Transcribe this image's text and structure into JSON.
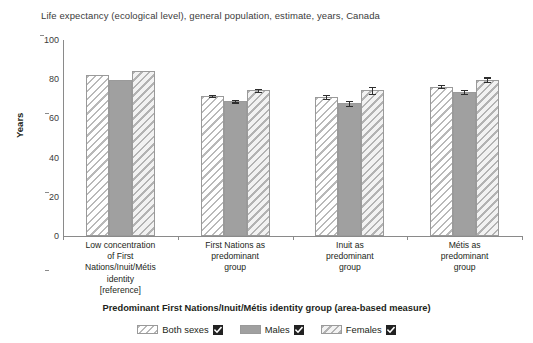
{
  "chart_data": {
    "type": "bar",
    "title": "Life expectancy (ecological level), general population, estimate, years, Canada",
    "xlabel": "Predominant First Nations/Inuit/Métis identity group (area-based measure)",
    "ylabel": "Years",
    "ylim": [
      0,
      100
    ],
    "yticks": [
      0,
      20,
      40,
      60,
      80,
      100
    ],
    "grid": false,
    "legend_position": "bottom",
    "categories": [
      "Low concentration of First Nations/Inuit/Métis identity [reference]",
      "First Nations as predominant group",
      "Inuit as predominant group",
      "Métis as predominant group"
    ],
    "category_lines": [
      [
        "Low concentration",
        "of First",
        "Nations/Inuit/Métis",
        "identity",
        "[reference]"
      ],
      [
        "First Nations as",
        "predominant",
        "group"
      ],
      [
        "Inuit as",
        "predominant",
        "group"
      ],
      [
        "Métis as",
        "predominant",
        "group"
      ]
    ],
    "series": [
      {
        "name": "Both sexes",
        "pattern": "hatch-a",
        "values": [
          82.0,
          71.5,
          71.0,
          76.2
        ],
        "errors": [
          0.0,
          0.5,
          1.0,
          0.8
        ]
      },
      {
        "name": "Males",
        "pattern": "solid",
        "values": [
          79.8,
          68.8,
          67.8,
          73.5
        ],
        "errors": [
          0.0,
          0.6,
          1.3,
          0.9
        ]
      },
      {
        "name": "Females",
        "pattern": "hatch-b",
        "values": [
          84.4,
          74.4,
          74.3,
          79.8
        ],
        "errors": [
          0.0,
          0.7,
          1.6,
          1.1
        ]
      }
    ]
  },
  "legend": {
    "items": [
      {
        "label": "Both sexes",
        "checked": true,
        "swatch": "hatch-a"
      },
      {
        "label": "Males",
        "checked": true,
        "swatch": "solid"
      },
      {
        "label": "Females",
        "checked": true,
        "swatch": "hatch-b"
      }
    ],
    "check_icon": "checkbox-checked-icon"
  },
  "colors": {
    "solid_fill": "#a0a0a0",
    "hatch_line": "#b9b9b9",
    "axis": "#8a8a8a",
    "text": "#231f20",
    "error_bar": "#2e2e2e",
    "checkbox": "#222222"
  }
}
